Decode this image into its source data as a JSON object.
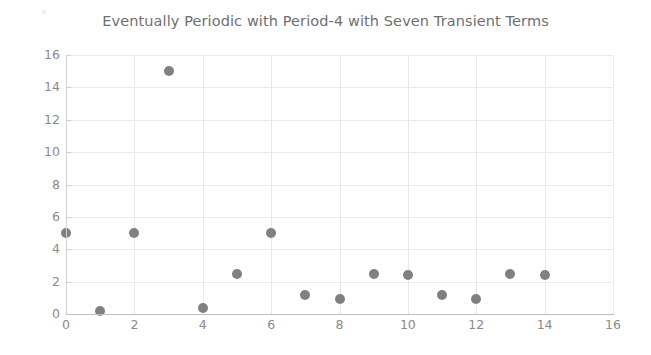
{
  "chart_data": {
    "type": "scatter",
    "title": "Eventually Periodic with Period-4 with Seven Transient Terms",
    "xlabel": "",
    "ylabel": "",
    "xlim": [
      0,
      16
    ],
    "ylim": [
      0,
      16
    ],
    "x_ticks": [
      0,
      2,
      4,
      6,
      8,
      10,
      12,
      14,
      16
    ],
    "y_ticks": [
      0,
      2,
      4,
      6,
      8,
      10,
      12,
      14,
      16
    ],
    "x_tick_labels": [
      "0",
      "2",
      "4",
      "6",
      "8",
      "10",
      "12",
      "14",
      "16"
    ],
    "y_tick_labels": [
      "0",
      "2",
      "4",
      "6",
      "8",
      "10",
      "12",
      "14",
      "16"
    ],
    "grid": true,
    "legend": false,
    "marker_color": "#808080",
    "marker_shape": "circle",
    "x": [
      0,
      1,
      2,
      3,
      4,
      5,
      6,
      7,
      8,
      9,
      10,
      11,
      12,
      13,
      14
    ],
    "y": [
      5,
      0.2,
      5,
      15,
      0.4,
      2.5,
      5,
      1.2,
      0.9,
      2.5,
      2.4,
      1.2,
      0.9,
      2.5,
      2.4
    ],
    "points": [
      {
        "x": 0,
        "y": 5
      },
      {
        "x": 1,
        "y": 0.2
      },
      {
        "x": 2,
        "y": 5
      },
      {
        "x": 3,
        "y": 15
      },
      {
        "x": 4,
        "y": 0.4
      },
      {
        "x": 5,
        "y": 2.5
      },
      {
        "x": 6,
        "y": 5
      },
      {
        "x": 7,
        "y": 1.2
      },
      {
        "x": 8,
        "y": 0.9
      },
      {
        "x": 9,
        "y": 2.5
      },
      {
        "x": 10,
        "y": 2.4
      },
      {
        "x": 11,
        "y": 1.2
      },
      {
        "x": 12,
        "y": 0.9
      },
      {
        "x": 13,
        "y": 2.5
      },
      {
        "x": 14,
        "y": 2.4
      }
    ]
  }
}
